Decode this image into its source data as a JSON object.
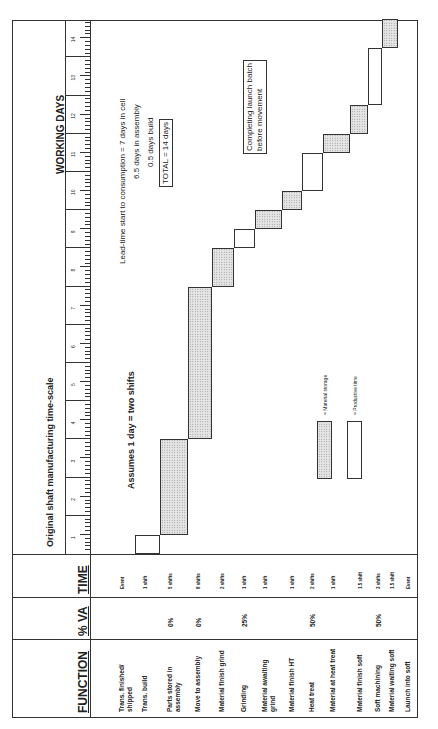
{
  "title": "Original shaft manufacturing time-scale",
  "headers": {
    "function": "FUNCTION",
    "va": "% VA",
    "time": "TIME",
    "axis": "WORKING DAYS"
  },
  "assumption": "Assumes 1 day = two shifts",
  "notes": {
    "lead_time": "Lead-time start to consumption = 7 days in cell",
    "assembly": "6.5 days in assembly",
    "build": "0.5 days build",
    "total": "TOTAL = 14 days",
    "batch": [
      "Completing launch batch",
      "before movement"
    ]
  },
  "legend": {
    "storage": "= Material storage",
    "productive": "= Productive time"
  },
  "rows": [
    {
      "function": "Trans. finished/ shipped",
      "va": "",
      "time": "Event"
    },
    {
      "function": "Trans. build",
      "va": "",
      "time": "1 shift"
    },
    {
      "function": "Parts stored in assembly",
      "va": "0%",
      "time": "5 shifts"
    },
    {
      "function": "Move to assembly",
      "va": "0%",
      "time": "8 shifts"
    },
    {
      "function": "Material finish grind",
      "va": "",
      "time": "2 shifts"
    },
    {
      "function": "Grinding",
      "va": "25%",
      "time": "1 shift"
    },
    {
      "function": "Material awaiting grind",
      "va": "",
      "time": "1 shift"
    },
    {
      "function": "Material finish HT",
      "va": "",
      "time": "1 shift"
    },
    {
      "function": "Heat treat",
      "va": "50%",
      "time": "2 shifts"
    },
    {
      "function": "Material at heat treat",
      "va": "",
      "time": "1 shift"
    },
    {
      "function": "Material finish soft",
      "va": "",
      "time": "1.5 shift"
    },
    {
      "function": "Soft machining",
      "va": "50%",
      "time": "3 shifts"
    },
    {
      "function": "Material waiting soft",
      "va": "",
      "time": "1.5 shift"
    },
    {
      "function": "Launch into soft",
      "va": "",
      "time": "Event"
    }
  ],
  "days": [
    "1",
    "2",
    "3",
    "4",
    "5",
    "6",
    "7",
    "8",
    "9",
    "10",
    "11",
    "12",
    "13",
    "14"
  ],
  "chart_data": {
    "type": "gantt",
    "title": "Original shaft manufacturing time-scale",
    "xlabel": "WORKING DAYS",
    "xlim": [
      0,
      14
    ],
    "tasks": [
      {
        "name": "Trans. build",
        "start": 0.0,
        "end": 0.5,
        "kind": "productive"
      },
      {
        "name": "Parts stored in assembly",
        "start": 0.5,
        "end": 3.0,
        "kind": "storage"
      },
      {
        "name": "Move to assembly",
        "start": 3.0,
        "end": 7.0,
        "kind": "storage"
      },
      {
        "name": "Material finish grind",
        "start": 7.0,
        "end": 8.0,
        "kind": "storage"
      },
      {
        "name": "Grinding",
        "start": 8.0,
        "end": 8.5,
        "kind": "productive"
      },
      {
        "name": "Material awaiting grind",
        "start": 8.5,
        "end": 9.0,
        "kind": "storage"
      },
      {
        "name": "Material finish HT",
        "start": 9.0,
        "end": 9.5,
        "kind": "storage"
      },
      {
        "name": "Heat treat",
        "start": 9.5,
        "end": 10.5,
        "kind": "productive"
      },
      {
        "name": "Material at heat treat",
        "start": 10.5,
        "end": 11.0,
        "kind": "storage"
      },
      {
        "name": "Material finish soft",
        "start": 11.0,
        "end": 11.75,
        "kind": "storage"
      },
      {
        "name": "Soft machining",
        "start": 11.75,
        "end": 13.25,
        "kind": "productive"
      },
      {
        "name": "Material waiting soft",
        "start": 13.25,
        "end": 14.0,
        "kind": "storage"
      }
    ]
  }
}
